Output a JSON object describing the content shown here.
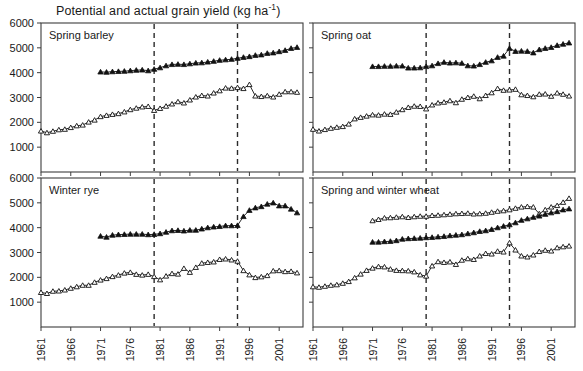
{
  "figure": {
    "title_text": "Potential and actual grain yield (kg ha",
    "title_sup": "-1",
    "title_tail": ")",
    "title_full": "Potential and actual grain yield (kg ha-1)"
  },
  "axes": {
    "y_ticks": [
      1000,
      2000,
      3000,
      4000,
      5000,
      6000
    ],
    "y_min": 0,
    "y_max": 6000,
    "x_ticks": [
      1961,
      1966,
      1971,
      1976,
      1981,
      1986,
      1991,
      1996,
      2001
    ],
    "x_min": 1961,
    "x_max": 2005,
    "x_tick_labels": [
      "1961",
      "1966",
      "1971",
      "1976",
      "1981",
      "1986",
      "1991",
      "1996",
      "2001"
    ],
    "y_tick_labels": [
      "1000",
      "2000",
      "3000",
      "4000",
      "5000",
      "6000"
    ],
    "reference_lines": [
      1980,
      1994
    ],
    "grid": false,
    "legend": "none"
  },
  "colors": {
    "axis": "#3d3d3d",
    "line": "#111111",
    "marker_filled": "#111111",
    "marker_open_fill": "#ffffff",
    "reference_line": "#2b2b2b",
    "background": "#ffffff"
  },
  "chart_data": [
    {
      "type": "line",
      "title": "Spring barley",
      "panel": "top-left",
      "xlabel": "",
      "ylabel": "",
      "ylim": [
        0,
        6000
      ],
      "xlim": [
        1961,
        2005
      ],
      "grid": false,
      "legend": "none",
      "annotations": [
        {
          "type": "vline",
          "x": 1980
        },
        {
          "type": "vline",
          "x": 1994
        }
      ],
      "series": [
        {
          "name": "Potential yield",
          "marker": "filled-triangle",
          "x": [
            1971,
            1972,
            1973,
            1974,
            1975,
            1976,
            1977,
            1978,
            1979,
            1980,
            1981,
            1982,
            1983,
            1984,
            1985,
            1986,
            1987,
            1988,
            1989,
            1990,
            1991,
            1992,
            1993,
            1994,
            1995,
            1996,
            1997,
            1998,
            1999,
            2000,
            2001,
            2002,
            2003,
            2004
          ],
          "values": [
            4030,
            4020,
            4040,
            4050,
            4060,
            4080,
            4100,
            4110,
            4080,
            4140,
            4200,
            4280,
            4330,
            4340,
            4330,
            4360,
            4390,
            4400,
            4430,
            4460,
            4500,
            4520,
            4540,
            4580,
            4620,
            4650,
            4700,
            4720,
            4780,
            4800,
            4850,
            4900,
            4980,
            5020
          ]
        },
        {
          "name": "Actual yield",
          "marker": "open-triangle",
          "x": [
            1961,
            1962,
            1963,
            1964,
            1965,
            1966,
            1967,
            1968,
            1969,
            1970,
            1971,
            1972,
            1973,
            1974,
            1975,
            1976,
            1977,
            1978,
            1979,
            1980,
            1981,
            1982,
            1983,
            1984,
            1985,
            1986,
            1987,
            1988,
            1989,
            1990,
            1991,
            1992,
            1993,
            1994,
            1995,
            1996,
            1997,
            1998,
            1999,
            2000,
            2001,
            2002,
            2003,
            2004
          ],
          "values": [
            1650,
            1580,
            1640,
            1700,
            1720,
            1790,
            1860,
            1890,
            2010,
            2090,
            2230,
            2280,
            2320,
            2350,
            2420,
            2510,
            2570,
            2620,
            2640,
            2480,
            2560,
            2650,
            2740,
            2830,
            2780,
            2900,
            3020,
            3080,
            3060,
            3180,
            3270,
            3380,
            3370,
            3400,
            3360,
            3520,
            3060,
            3040,
            3070,
            3020,
            3130,
            3230,
            3230,
            3210
          ]
        }
      ]
    },
    {
      "type": "line",
      "title": "Spring oat",
      "panel": "top-right",
      "xlabel": "",
      "ylabel": "",
      "ylim": [
        0,
        6000
      ],
      "xlim": [
        1961,
        2005
      ],
      "grid": false,
      "legend": "none",
      "annotations": [
        {
          "type": "vline",
          "x": 1980
        },
        {
          "type": "vline",
          "x": 1994
        }
      ],
      "series": [
        {
          "name": "Potential yield",
          "marker": "filled-triangle",
          "x": [
            1971,
            1972,
            1973,
            1974,
            1975,
            1976,
            1977,
            1978,
            1979,
            1980,
            1981,
            1982,
            1983,
            1984,
            1985,
            1986,
            1987,
            1988,
            1989,
            1990,
            1991,
            1992,
            1993,
            1994,
            1995,
            1996,
            1997,
            1998,
            1999,
            2000,
            2001,
            2002,
            2003,
            2004
          ],
          "values": [
            4250,
            4250,
            4260,
            4260,
            4270,
            4270,
            4190,
            4190,
            4200,
            4250,
            4280,
            4370,
            4420,
            4390,
            4400,
            4380,
            4280,
            4270,
            4330,
            4420,
            4480,
            4620,
            4670,
            4980,
            4860,
            4870,
            4860,
            4800,
            4930,
            4980,
            5020,
            5100,
            5150,
            5200
          ]
        },
        {
          "name": "Actual yield",
          "marker": "open-triangle",
          "x": [
            1961,
            1962,
            1963,
            1964,
            1965,
            1966,
            1967,
            1968,
            1969,
            1970,
            1971,
            1972,
            1973,
            1974,
            1975,
            1976,
            1977,
            1978,
            1979,
            1980,
            1981,
            1982,
            1983,
            1984,
            1985,
            1986,
            1987,
            1988,
            1989,
            1990,
            1991,
            1992,
            1993,
            1994,
            1995,
            1996,
            1997,
            1998,
            1999,
            2000,
            2001,
            2002,
            2003,
            2004
          ],
          "values": [
            1720,
            1650,
            1710,
            1760,
            1800,
            1830,
            1930,
            2140,
            2200,
            2250,
            2300,
            2290,
            2330,
            2320,
            2410,
            2510,
            2600,
            2650,
            2640,
            2540,
            2700,
            2780,
            2810,
            2870,
            2790,
            2930,
            3000,
            3050,
            2950,
            3080,
            3190,
            3360,
            3290,
            3300,
            3330,
            3110,
            3080,
            3030,
            3130,
            3140,
            3050,
            3180,
            3130,
            3060
          ]
        }
      ]
    },
    {
      "type": "line",
      "title": "Winter rye",
      "panel": "bottom-left",
      "xlabel": "",
      "ylabel": "",
      "ylim": [
        0,
        6000
      ],
      "xlim": [
        1961,
        2005
      ],
      "grid": false,
      "legend": "none",
      "annotations": [
        {
          "type": "vline",
          "x": 1980
        },
        {
          "type": "vline",
          "x": 1994
        }
      ],
      "series": [
        {
          "name": "Potential yield",
          "marker": "filled-triangle",
          "x": [
            1971,
            1972,
            1973,
            1974,
            1975,
            1976,
            1977,
            1978,
            1979,
            1980,
            1981,
            1982,
            1983,
            1984,
            1985,
            1986,
            1987,
            1988,
            1989,
            1990,
            1991,
            1992,
            1993,
            1994,
            1995,
            1996,
            1997,
            1998,
            1999,
            2000,
            2001,
            2002,
            2003,
            2004
          ],
          "values": [
            3660,
            3620,
            3700,
            3720,
            3730,
            3740,
            3740,
            3740,
            3720,
            3730,
            3760,
            3820,
            3880,
            3890,
            3870,
            3900,
            3900,
            3950,
            4000,
            4030,
            4050,
            4080,
            4080,
            4090,
            4450,
            4700,
            4800,
            4850,
            4950,
            5000,
            4880,
            4880,
            4750,
            4600
          ]
        },
        {
          "name": "Actual yield",
          "marker": "open-triangle",
          "x": [
            1961,
            1962,
            1963,
            1964,
            1965,
            1966,
            1967,
            1968,
            1969,
            1970,
            1971,
            1972,
            1973,
            1974,
            1975,
            1976,
            1977,
            1978,
            1979,
            1980,
            1981,
            1982,
            1983,
            1984,
            1985,
            1986,
            1987,
            1988,
            1989,
            1990,
            1991,
            1992,
            1993,
            1994,
            1995,
            1996,
            1997,
            1998,
            1999,
            2000,
            2001,
            2002,
            2003,
            2004
          ],
          "values": [
            1390,
            1350,
            1440,
            1450,
            1490,
            1560,
            1620,
            1680,
            1680,
            1800,
            1890,
            1950,
            2030,
            2090,
            2170,
            2200,
            2120,
            2090,
            2120,
            2030,
            1900,
            2050,
            2150,
            2130,
            2360,
            2200,
            2400,
            2570,
            2600,
            2620,
            2720,
            2740,
            2700,
            2650,
            2270,
            2100,
            1990,
            2020,
            2070,
            2260,
            2270,
            2230,
            2240,
            2180
          ]
        }
      ]
    },
    {
      "type": "line",
      "title": "Spring and winter wheat",
      "panel": "bottom-right",
      "xlabel": "",
      "ylabel": "",
      "ylim": [
        0,
        6000
      ],
      "xlim": [
        1961,
        2005
      ],
      "grid": false,
      "legend": "none",
      "annotations": [
        {
          "type": "vline",
          "x": 1980
        },
        {
          "type": "vline",
          "x": 1994
        }
      ],
      "series": [
        {
          "name": "Potential yield winter wheat",
          "marker": "open-triangle",
          "x": [
            1971,
            1972,
            1973,
            1974,
            1975,
            1976,
            1977,
            1978,
            1979,
            1980,
            1981,
            1982,
            1983,
            1984,
            1985,
            1986,
            1987,
            1988,
            1989,
            1990,
            1991,
            1992,
            1993,
            1994,
            1995,
            1996,
            1997,
            1998,
            1999,
            2000,
            2001,
            2002,
            2003,
            2004
          ],
          "values": [
            4280,
            4330,
            4390,
            4400,
            4420,
            4440,
            4410,
            4440,
            4460,
            4460,
            4490,
            4500,
            4520,
            4540,
            4560,
            4570,
            4580,
            4550,
            4560,
            4580,
            4620,
            4660,
            4680,
            4720,
            4780,
            4830,
            4850,
            4830,
            4560,
            4720,
            4830,
            4890,
            5020,
            5180
          ]
        },
        {
          "name": "Potential yield spring wheat",
          "marker": "filled-triangle",
          "x": [
            1971,
            1972,
            1973,
            1974,
            1975,
            1976,
            1977,
            1978,
            1979,
            1980,
            1981,
            1982,
            1983,
            1984,
            1985,
            1986,
            1987,
            1988,
            1989,
            1990,
            1991,
            1992,
            1993,
            1994,
            1995,
            1996,
            1997,
            1998,
            1999,
            2000,
            2001,
            2002,
            2003,
            2004
          ],
          "values": [
            3420,
            3420,
            3440,
            3450,
            3480,
            3540,
            3560,
            3570,
            3580,
            3600,
            3610,
            3630,
            3650,
            3680,
            3700,
            3720,
            3760,
            3800,
            3850,
            3880,
            3930,
            4000,
            4060,
            4120,
            4200,
            4300,
            4360,
            4420,
            4470,
            4540,
            4600,
            4650,
            4720,
            4760
          ]
        },
        {
          "name": "Actual yield",
          "marker": "open-triangle",
          "x": [
            1961,
            1962,
            1963,
            1964,
            1965,
            1966,
            1967,
            1968,
            1969,
            1970,
            1971,
            1972,
            1973,
            1974,
            1975,
            1976,
            1977,
            1978,
            1979,
            1980,
            1981,
            1982,
            1983,
            1984,
            1985,
            1986,
            1987,
            1988,
            1989,
            1990,
            1991,
            1992,
            1993,
            1994,
            1995,
            1996,
            1997,
            1998,
            1999,
            2000,
            2001,
            2002,
            2003,
            2004
          ],
          "values": [
            1620,
            1600,
            1640,
            1680,
            1700,
            1760,
            1830,
            1980,
            2130,
            2280,
            2370,
            2430,
            2420,
            2330,
            2280,
            2270,
            2260,
            2220,
            2100,
            2050,
            2460,
            2630,
            2600,
            2620,
            2520,
            2690,
            2750,
            2720,
            2860,
            2960,
            2940,
            3050,
            3020,
            3390,
            3100,
            2860,
            2820,
            2900,
            3040,
            3090,
            3060,
            3190,
            3230,
            3260
          ]
        }
      ]
    }
  ]
}
